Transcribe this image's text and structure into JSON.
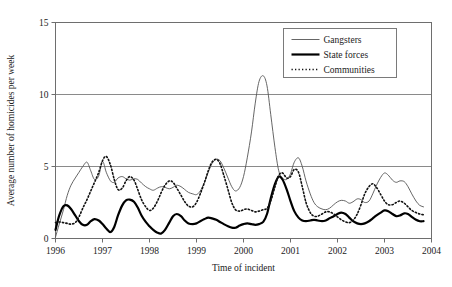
{
  "chart_data": {
    "type": "line",
    "title": "",
    "xlabel": "Time of incident",
    "ylabel": "Average number of homicides per week",
    "xlim": [
      1996,
      2004
    ],
    "ylim": [
      0,
      15
    ],
    "yticks": [
      0,
      5,
      10,
      15
    ],
    "xticks": [
      1996,
      1997,
      1998,
      1999,
      2000,
      2001,
      2002,
      2003,
      2004
    ],
    "xtick_labels": [
      "1996",
      "1997",
      "1998",
      "1999",
      "2000",
      "2001",
      "2002",
      "2003",
      "2004"
    ],
    "ytick_labels": [
      "0",
      "5",
      "10",
      "15"
    ],
    "grid": "horizontal",
    "legend_position": "top-right",
    "series": [
      {
        "name": "Gangsters",
        "style": "solid-thin",
        "color": "#444444",
        "x": [
          1996.0,
          1996.08,
          1996.17,
          1996.25,
          1996.33,
          1996.42,
          1996.5,
          1996.58,
          1996.67,
          1996.75,
          1996.83,
          1996.92,
          1997.0,
          1997.08,
          1997.17,
          1997.25,
          1997.33,
          1997.42,
          1997.5,
          1997.58,
          1997.67,
          1997.75,
          1997.83,
          1997.92,
          1998.0,
          1998.08,
          1998.17,
          1998.25,
          1998.33,
          1998.42,
          1998.5,
          1998.58,
          1998.67,
          1998.75,
          1998.83,
          1998.92,
          1999.0,
          1999.08,
          1999.17,
          1999.25,
          1999.33,
          1999.42,
          1999.5,
          1999.58,
          1999.67,
          1999.75,
          1999.83,
          1999.92,
          2000.0,
          2000.08,
          2000.17,
          2000.25,
          2000.33,
          2000.42,
          2000.5,
          2000.58,
          2000.67,
          2000.75,
          2000.83,
          2000.92,
          2001.0,
          2001.08,
          2001.17,
          2001.25,
          2001.33,
          2001.42,
          2001.5,
          2001.58,
          2001.67,
          2001.75,
          2001.83,
          2001.92,
          2002.0,
          2002.08,
          2002.17,
          2002.25,
          2002.33,
          2002.42,
          2002.5,
          2002.58,
          2002.67,
          2002.75,
          2002.83,
          2002.92,
          2003.0,
          2003.08,
          2003.17,
          2003.25,
          2003.33,
          2003.42,
          2003.5,
          2003.58,
          2003.67,
          2003.75,
          2003.83
        ],
        "y": [
          0.1,
          1.0,
          2.0,
          3.0,
          3.7,
          4.2,
          4.6,
          5.0,
          5.3,
          4.7,
          4.1,
          4.35,
          5.35,
          4.6,
          4.0,
          3.9,
          4.2,
          4.3,
          4.15,
          4.05,
          4.15,
          4.1,
          3.85,
          3.6,
          3.45,
          3.35,
          3.5,
          3.6,
          3.55,
          3.45,
          3.55,
          3.7,
          3.6,
          3.4,
          3.2,
          3.1,
          3.05,
          3.3,
          3.9,
          4.6,
          5.2,
          5.5,
          5.4,
          4.9,
          4.2,
          3.6,
          3.3,
          3.55,
          4.3,
          5.6,
          7.4,
          9.4,
          10.9,
          11.3,
          10.6,
          8.6,
          6.3,
          4.7,
          4.2,
          4.1,
          4.5,
          5.3,
          5.6,
          5.0,
          4.0,
          3.1,
          2.5,
          2.2,
          2.05,
          2.0,
          2.1,
          2.35,
          2.55,
          2.65,
          2.6,
          2.45,
          2.55,
          2.75,
          2.7,
          2.5,
          2.6,
          3.1,
          3.7,
          4.25,
          4.55,
          4.4,
          4.05,
          3.9,
          4.0,
          3.95,
          3.6,
          3.1,
          2.6,
          2.3,
          2.2
        ]
      },
      {
        "name": "State forces",
        "style": "solid-thick",
        "color": "#000000",
        "x": [
          1996.0,
          1996.08,
          1996.17,
          1996.25,
          1996.33,
          1996.42,
          1996.5,
          1996.58,
          1996.67,
          1996.75,
          1996.83,
          1996.92,
          1997.0,
          1997.08,
          1997.17,
          1997.25,
          1997.33,
          1997.42,
          1997.5,
          1997.58,
          1997.67,
          1997.75,
          1997.83,
          1997.92,
          1998.0,
          1998.08,
          1998.17,
          1998.25,
          1998.33,
          1998.42,
          1998.5,
          1998.58,
          1998.67,
          1998.75,
          1998.83,
          1998.92,
          1999.0,
          1999.08,
          1999.17,
          1999.25,
          1999.33,
          1999.42,
          1999.5,
          1999.58,
          1999.67,
          1999.75,
          1999.83,
          1999.92,
          2000.0,
          2000.08,
          2000.17,
          2000.25,
          2000.33,
          2000.42,
          2000.5,
          2000.58,
          2000.67,
          2000.75,
          2000.83,
          2000.92,
          2001.0,
          2001.08,
          2001.17,
          2001.25,
          2001.33,
          2001.42,
          2001.5,
          2001.58,
          2001.67,
          2001.75,
          2001.83,
          2001.92,
          2002.0,
          2002.08,
          2002.17,
          2002.25,
          2002.33,
          2002.42,
          2002.5,
          2002.58,
          2002.67,
          2002.75,
          2002.83,
          2002.92,
          2003.0,
          2003.08,
          2003.17,
          2003.25,
          2003.33,
          2003.42,
          2003.5,
          2003.58,
          2003.67,
          2003.75,
          2003.83
        ],
        "y": [
          0.6,
          1.6,
          2.25,
          2.3,
          2.05,
          1.6,
          1.2,
          0.95,
          0.95,
          1.2,
          1.35,
          1.25,
          1.0,
          0.7,
          0.45,
          0.8,
          1.6,
          2.3,
          2.65,
          2.7,
          2.55,
          2.15,
          1.6,
          1.15,
          0.85,
          0.6,
          0.4,
          0.35,
          0.6,
          1.1,
          1.55,
          1.7,
          1.55,
          1.25,
          1.05,
          1.0,
          1.05,
          1.2,
          1.35,
          1.45,
          1.4,
          1.3,
          1.15,
          1.0,
          0.85,
          0.75,
          0.75,
          0.9,
          1.0,
          1.05,
          1.0,
          0.95,
          1.0,
          1.15,
          1.7,
          2.8,
          3.8,
          4.3,
          4.1,
          3.4,
          2.6,
          1.9,
          1.45,
          1.25,
          1.2,
          1.25,
          1.3,
          1.25,
          1.2,
          1.25,
          1.4,
          1.55,
          1.7,
          1.8,
          1.7,
          1.45,
          1.2,
          1.05,
          1.0,
          1.05,
          1.2,
          1.4,
          1.6,
          1.8,
          1.95,
          1.9,
          1.7,
          1.55,
          1.6,
          1.75,
          1.7,
          1.5,
          1.3,
          1.2,
          1.2
        ]
      },
      {
        "name": "Communities",
        "style": "dotted",
        "color": "#111111",
        "x": [
          1996.0,
          1996.08,
          1996.17,
          1996.25,
          1996.33,
          1996.42,
          1996.5,
          1996.58,
          1996.67,
          1996.75,
          1996.83,
          1996.92,
          1997.0,
          1997.08,
          1997.17,
          1997.25,
          1997.33,
          1997.42,
          1997.5,
          1997.58,
          1997.67,
          1997.75,
          1997.83,
          1997.92,
          1998.0,
          1998.08,
          1998.17,
          1998.25,
          1998.33,
          1998.42,
          1998.5,
          1998.58,
          1998.67,
          1998.75,
          1998.83,
          1998.92,
          1999.0,
          1999.08,
          1999.17,
          1999.25,
          1999.33,
          1999.42,
          1999.5,
          1999.58,
          1999.67,
          1999.75,
          1999.83,
          1999.92,
          2000.0,
          2000.08,
          2000.17,
          2000.25,
          2000.33,
          2000.42,
          2000.5,
          2000.58,
          2000.67,
          2000.75,
          2000.83,
          2000.92,
          2001.0,
          2001.08,
          2001.17,
          2001.25,
          2001.33,
          2001.42,
          2001.5,
          2001.58,
          2001.67,
          2001.75,
          2001.83,
          2001.92,
          2002.0,
          2002.08,
          2002.17,
          2002.25,
          2002.33,
          2002.42,
          2002.5,
          2002.58,
          2002.67,
          2002.75,
          2002.83,
          2002.92,
          2003.0,
          2003.08,
          2003.17,
          2003.25,
          2003.33,
          2003.42,
          2003.5,
          2003.58,
          2003.67,
          2003.75,
          2003.83
        ],
        "y": [
          1.1,
          1.15,
          1.1,
          1.05,
          1.0,
          1.1,
          1.5,
          2.1,
          2.7,
          3.3,
          3.9,
          4.6,
          5.4,
          5.7,
          5.1,
          4.1,
          3.4,
          3.5,
          4.0,
          4.3,
          4.05,
          3.4,
          2.7,
          2.2,
          1.95,
          2.1,
          2.6,
          3.2,
          3.7,
          4.0,
          3.9,
          3.5,
          3.0,
          2.55,
          2.25,
          2.2,
          2.5,
          3.1,
          3.9,
          4.7,
          5.3,
          5.5,
          5.2,
          4.4,
          3.4,
          2.5,
          2.0,
          1.9,
          2.0,
          2.05,
          1.95,
          1.85,
          1.9,
          2.0,
          2.1,
          2.6,
          3.6,
          4.4,
          4.55,
          4.2,
          4.3,
          4.8,
          4.6,
          3.6,
          2.5,
          1.8,
          1.55,
          1.55,
          1.7,
          1.85,
          1.85,
          1.7,
          1.5,
          1.3,
          1.15,
          1.1,
          1.25,
          1.7,
          2.35,
          3.1,
          3.6,
          3.8,
          3.55,
          3.05,
          2.6,
          2.35,
          2.35,
          2.5,
          2.6,
          2.45,
          2.2,
          1.95,
          1.8,
          1.7,
          1.65
        ]
      }
    ],
    "legend_entries": [
      {
        "label": "Gangsters",
        "style": "solid-thin"
      },
      {
        "label": "State forces",
        "style": "solid-thick"
      },
      {
        "label": "Communities",
        "style": "dotted"
      }
    ]
  }
}
